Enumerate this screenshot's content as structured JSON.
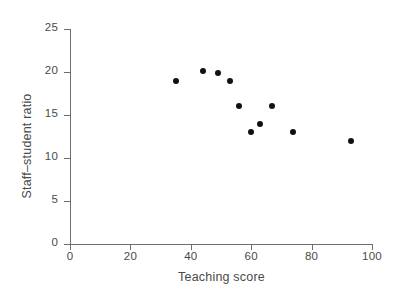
{
  "chart_data": {
    "type": "scatter",
    "title": "",
    "xlabel": "Teaching score",
    "ylabel": "Staff–student ratio",
    "xlim": [
      0,
      100
    ],
    "ylim": [
      0,
      25
    ],
    "xticks": [
      0,
      20,
      40,
      60,
      80,
      100
    ],
    "yticks": [
      0,
      5,
      10,
      15,
      20,
      25
    ],
    "xtick_labels": [
      "0",
      "20",
      "40",
      "60",
      "80",
      "100"
    ],
    "ytick_labels": [
      "0",
      "5",
      "10",
      "15",
      "20",
      "25"
    ],
    "grid": false,
    "legend": null,
    "marker": {
      "shape": "circle",
      "color": "#111111",
      "size_px": 6
    },
    "axis_color": "#6e6e6e",
    "text_color": "#4a4a4a",
    "background": "#ffffff",
    "points": [
      {
        "x": 35,
        "y": 18.9
      },
      {
        "x": 44,
        "y": 20.1
      },
      {
        "x": 49,
        "y": 19.9
      },
      {
        "x": 53,
        "y": 18.9
      },
      {
        "x": 56,
        "y": 16.0
      },
      {
        "x": 60,
        "y": 13.0
      },
      {
        "x": 63,
        "y": 14.0
      },
      {
        "x": 67,
        "y": 16.0
      },
      {
        "x": 74,
        "y": 13.0
      },
      {
        "x": 93,
        "y": 12.0
      }
    ]
  },
  "figure": {
    "caption_sliver": ""
  }
}
